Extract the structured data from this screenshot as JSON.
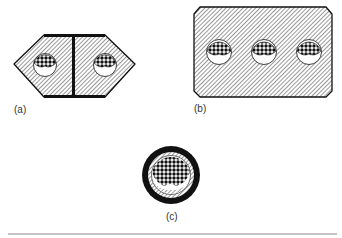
{
  "figures": [
    {
      "id": "a",
      "label": "(a)",
      "description": "Hexagonal section with central I-beam web and two holes containing bundled strands"
    },
    {
      "id": "b",
      "label": "(b)",
      "description": "Rectangular chamfered section with three holes containing bundled strands"
    },
    {
      "id": "c",
      "label": "(c)",
      "description": "Circular cable cross-section with sheath, hatched layer and dense strand bundle"
    }
  ],
  "colors": {
    "ink": "#111111",
    "hatch": "#444444",
    "background": "#ffffff",
    "rule": "#888888"
  }
}
